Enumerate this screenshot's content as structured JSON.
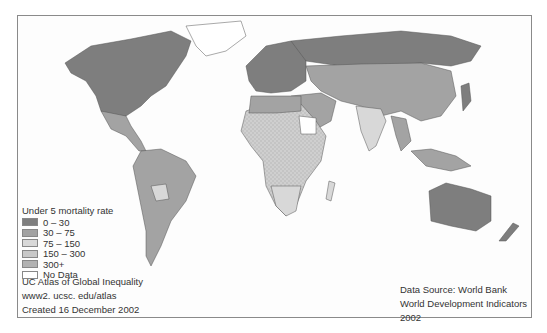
{
  "map": {
    "title": "Under 5 mortality rate",
    "colors": {
      "band_0_30": "#7e7e7e",
      "band_30_75": "#a3a3a3",
      "band_75_150": "#d2d2d2",
      "band_150_300": "#c4c4c4",
      "band_300_plus": "#b5b5b5",
      "no_data": "#ffffff",
      "border": "#8a8a8a"
    }
  },
  "legend": {
    "title": "Under 5 mortality rate",
    "items": [
      {
        "label": "0 – 30",
        "color": "#7e7e7e"
      },
      {
        "label": "30 – 75",
        "color": "#a3a3a3"
      },
      {
        "label": "75 – 150",
        "color": "#d8d8d8"
      },
      {
        "label": "150 – 300",
        "color": "#c8c8c8"
      },
      {
        "label": "300+",
        "color": "#b2b2b2"
      },
      {
        "label": "No Data",
        "color": "#ffffff"
      }
    ]
  },
  "credits": {
    "line1": "UC Atlas of Global Inequality",
    "line2": "www2. ucsc. edu/atlas",
    "line3": "Created 16 December 2002"
  },
  "source": {
    "line1": "Data Source: World Bank",
    "line2": "World Development Indicators 2002"
  }
}
